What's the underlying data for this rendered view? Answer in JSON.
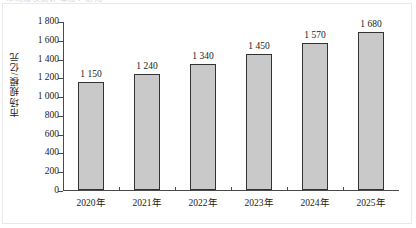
{
  "figure": {
    "clipped_title": "市场规模统计      单位：亿元",
    "background_color": "#ffffff",
    "frame_color": "#e9e9ec"
  },
  "chart_data": {
    "type": "bar",
    "title": "",
    "xlabel": "",
    "ylabel": "市场规模/亿元",
    "categories": [
      "2020年",
      "2021年",
      "2022年",
      "2023年",
      "2024年",
      "2025年"
    ],
    "values": [
      1150,
      1240,
      1340,
      1450,
      1570,
      1680
    ],
    "value_labels": [
      "1 150",
      "1 240",
      "1 340",
      "1 450",
      "1 570",
      "1 680"
    ],
    "ylim": [
      0,
      1800
    ],
    "ytick_values": [
      0,
      200,
      400,
      600,
      800,
      1000,
      1200,
      1400,
      1600,
      1800
    ],
    "ytick_labels": [
      "0",
      "200",
      "400",
      "600",
      "800",
      "1 000",
      "1 200",
      "1 400",
      "1 600",
      "1 800"
    ],
    "grid": false,
    "legend": null,
    "bar_fill_color": "#c9c9c9",
    "bar_edge_color": "#333333",
    "axis_color": "#4a4a4a"
  }
}
